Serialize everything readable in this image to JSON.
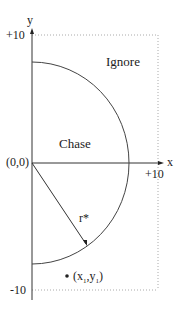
{
  "diagram": {
    "axes": {
      "y_label": "y",
      "x_label": "x",
      "origin_label": "(0,0)",
      "y_max_label": "+10",
      "y_min_label": "-10",
      "x_max_label": "+10"
    },
    "regions": {
      "inner": "Chase",
      "outer": "Ignore"
    },
    "radius_label": "r*",
    "point": {
      "label_open": "(x",
      "sub1": "1",
      "label_mid": ",y",
      "sub2": "1",
      "label_close": ")"
    },
    "colors": {
      "line": "#333333",
      "dotted": "#aaaaaa"
    }
  }
}
